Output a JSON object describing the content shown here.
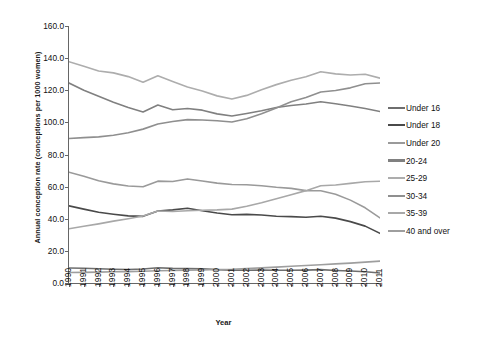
{
  "chart_data": {
    "type": "line",
    "title": "",
    "xlabel": "Year",
    "ylabel": "Annual conception rate (conceptions per 1000 women)",
    "x": [
      1990,
      1991,
      1992,
      1993,
      1994,
      1995,
      1996,
      1997,
      1998,
      1999,
      2000,
      2001,
      2002,
      2003,
      2004,
      2005,
      2006,
      2007,
      2008,
      2009,
      2010,
      2011
    ],
    "xtick_labels": [
      "1990",
      "1991",
      "1992",
      "1993",
      "1994",
      "1995",
      "1996",
      "1997",
      "1998",
      "1999",
      "2000",
      "2001",
      "2002",
      "2003",
      "2004",
      "2005",
      "2006",
      "2007",
      "2008",
      "2009",
      "2010",
      "2011"
    ],
    "ytick_labels": [
      "0.0",
      "20.0",
      "40.0",
      "60.0",
      "80.0",
      "100.0",
      "120.0",
      "140.0",
      "160.0"
    ],
    "ylim": [
      0,
      160
    ],
    "ytick_step": 20,
    "grid": false,
    "legend_position": "right",
    "series": [
      {
        "name": "Under 16",
        "color": "#6e6e6e",
        "values": [
          9.3,
          9.2,
          8.9,
          8.6,
          8.4,
          8.7,
          9.5,
          9.1,
          9.0,
          8.9,
          8.3,
          8.0,
          7.9,
          8.0,
          7.9,
          7.9,
          8.0,
          8.3,
          7.8,
          7.5,
          7.0,
          6.2
        ]
      },
      {
        "name": "Under 18",
        "color": "#4a4a4a",
        "values": [
          48.0,
          46.0,
          44.0,
          42.8,
          41.8,
          41.5,
          44.8,
          45.5,
          46.5,
          45.0,
          43.6,
          42.5,
          42.7,
          42.3,
          41.6,
          41.3,
          40.9,
          41.6,
          40.4,
          38.2,
          35.4,
          30.9
        ]
      },
      {
        "name": "Under 20",
        "color": "#9a9a9a",
        "values": [
          69.0,
          66.5,
          63.6,
          61.7,
          60.4,
          59.9,
          63.4,
          63.2,
          64.8,
          63.5,
          62.2,
          61.3,
          61.2,
          60.5,
          59.6,
          58.9,
          57.5,
          57.4,
          55.3,
          51.6,
          46.8,
          40.5
        ]
      },
      {
        "name": "20-24",
        "color": "#808080",
        "values": [
          124.5,
          120.0,
          116.2,
          112.5,
          109.2,
          106.5,
          110.8,
          107.9,
          108.6,
          107.6,
          105.3,
          104.0,
          105.5,
          107.2,
          109.3,
          110.5,
          111.4,
          112.8,
          111.6,
          110.2,
          108.6,
          106.8
        ]
      },
      {
        "name": "25-29",
        "color": "#adadad",
        "values": [
          137.8,
          135.0,
          132.0,
          130.8,
          128.5,
          125.0,
          129.0,
          125.5,
          122.0,
          119.5,
          116.5,
          114.5,
          116.8,
          120.3,
          123.5,
          126.2,
          128.4,
          131.5,
          130.2,
          129.5,
          130.0,
          127.5
        ]
      },
      {
        "name": "30-34",
        "color": "#8f8f8f",
        "values": [
          90.0,
          90.5,
          91.0,
          92.0,
          93.5,
          95.8,
          99.0,
          100.5,
          101.7,
          101.5,
          101.0,
          100.2,
          102.2,
          105.4,
          109.0,
          112.8,
          115.5,
          118.9,
          119.8,
          121.5,
          124.0,
          124.5
        ]
      },
      {
        "name": "35-39",
        "color": "#a8a8a8",
        "values": [
          33.8,
          35.3,
          36.8,
          38.5,
          40.0,
          41.7,
          44.8,
          44.5,
          45.0,
          45.3,
          45.5,
          46.0,
          47.8,
          50.0,
          52.5,
          55.0,
          57.5,
          60.5,
          61.0,
          62.0,
          63.0,
          63.3
        ]
      },
      {
        "name": "40 and over",
        "color": "#9e9e9e",
        "values": [
          6.5,
          6.6,
          6.8,
          7.0,
          7.1,
          7.3,
          7.6,
          7.8,
          8.0,
          8.2,
          8.4,
          8.6,
          9.0,
          9.4,
          9.9,
          10.4,
          10.9,
          11.4,
          11.9,
          12.4,
          13.0,
          13.6
        ]
      }
    ]
  },
  "axes": {
    "y_title": "Annual conception rate (conceptions per 1000 women)",
    "x_title": "Year"
  }
}
